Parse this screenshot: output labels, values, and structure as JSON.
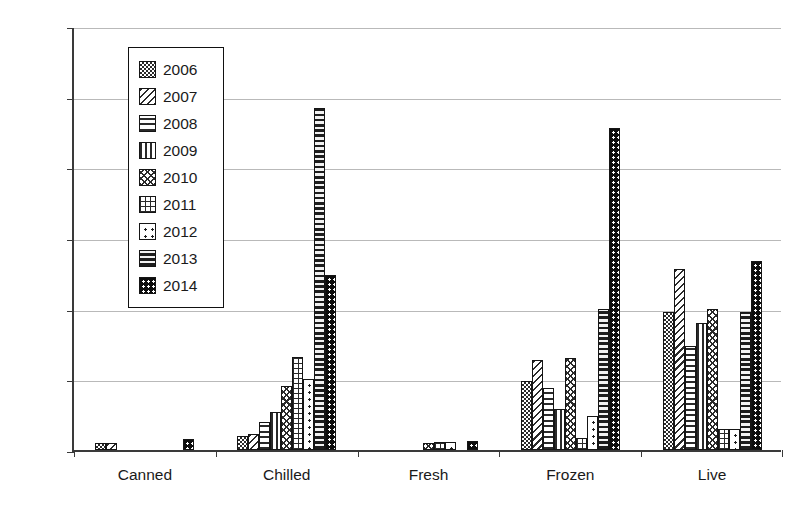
{
  "chart_data": {
    "type": "bar",
    "title": "",
    "xlabel": "",
    "ylabel": "Number of notifications",
    "ylim": [
      0,
      60
    ],
    "yticks": [
      0,
      10,
      20,
      30,
      40,
      50,
      60
    ],
    "grid": true,
    "legend_position": "upper-left-inside",
    "categories": [
      "Canned",
      "Chilled",
      "Fresh",
      "Frozen",
      "Live"
    ],
    "series": [
      {
        "name": "2006",
        "pattern": "fine-checkerboard",
        "values": [
          1,
          2,
          0,
          9.7,
          19.6
        ]
      },
      {
        "name": "2007",
        "pattern": "diagonal-stripes",
        "values": [
          1,
          2.2,
          0,
          12.8,
          25.6
        ]
      },
      {
        "name": "2008",
        "pattern": "horizontal-stripes",
        "values": [
          0,
          4,
          0,
          8.8,
          14.7
        ]
      },
      {
        "name": "2009",
        "pattern": "vertical-stripes",
        "values": [
          0,
          5.4,
          0,
          5.8,
          18
        ]
      },
      {
        "name": "2010",
        "pattern": "wavy-crosshatch",
        "values": [
          0,
          9,
          1,
          13,
          20
        ]
      },
      {
        "name": "2011",
        "pattern": "square-grid",
        "values": [
          0,
          13.2,
          1.2,
          1.7,
          3
        ]
      },
      {
        "name": "2012",
        "pattern": "sparse-dots",
        "values": [
          0,
          10,
          1.1,
          4.8,
          3
        ]
      },
      {
        "name": "2013",
        "pattern": "dense-bands",
        "values": [
          0,
          48.4,
          0,
          20,
          19.6
        ]
      },
      {
        "name": "2014",
        "pattern": "black-dotted",
        "values": [
          1.5,
          24.7,
          1.3,
          45.6,
          26.8
        ]
      }
    ]
  },
  "axes": {
    "y_tick_labels": [
      "0",
      "10",
      "20",
      "30",
      "40",
      "50",
      "60"
    ],
    "y_title": "Number of notifications"
  },
  "legend": {
    "entries": [
      {
        "label": "2006"
      },
      {
        "label": "2007"
      },
      {
        "label": "2008"
      },
      {
        "label": "2009"
      },
      {
        "label": "2010"
      },
      {
        "label": "2011"
      },
      {
        "label": "2012"
      },
      {
        "label": "2013"
      },
      {
        "label": "2014"
      }
    ]
  }
}
